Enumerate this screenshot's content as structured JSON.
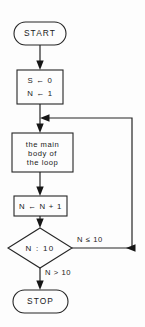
{
  "diagram": {
    "type": "flowchart",
    "background_color": "#fdfdfd",
    "stroke_color": "#262626",
    "text_color": "#1a1a1a"
  },
  "nodes": {
    "start": {
      "label": "START",
      "shape": "terminator"
    },
    "init": {
      "line1": "S ← 0",
      "line2": "N ← 1",
      "shape": "process"
    },
    "body": {
      "line1": "the main",
      "line2": "body of",
      "line3": "the loop",
      "shape": "process"
    },
    "increment": {
      "label": "N ← N + 1",
      "shape": "process"
    },
    "decision": {
      "label": "N  :  10",
      "shape": "decision"
    },
    "stop": {
      "label": "STOP",
      "shape": "terminator"
    }
  },
  "edges": {
    "loop_back_label": "N ≤ 10",
    "exit_label": "N > 10"
  }
}
